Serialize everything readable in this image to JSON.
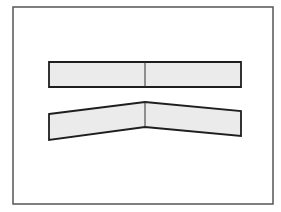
{
  "diagram": {
    "frame": {
      "x": 13,
      "y": 7,
      "width": 260,
      "height": 197,
      "stroke": "#555555"
    },
    "colors": {
      "fill": "#ebebeb",
      "stroke": "#1e1e1e",
      "divider": "#333333"
    },
    "flat_strip": {
      "outline": "49,62 241,62 241,87 49,87",
      "divider": {
        "x1": 145,
        "y1": 62,
        "x2": 145,
        "y2": 87
      }
    },
    "bent_strip": {
      "outline": "49,114 145,102 241,111 241,136 145,127 49,140",
      "divider": {
        "x1": 145,
        "y1": 102,
        "x2": 145,
        "y2": 127
      }
    }
  }
}
